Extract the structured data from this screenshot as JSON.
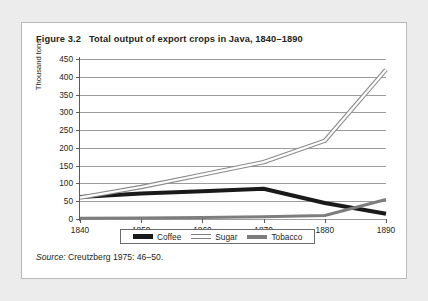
{
  "figure": {
    "title": "Figure 3.2   Total output of export crops in Java, 1840–1890",
    "source_label": "Source:",
    "source_text": " Creutzberg 1975: 46–50."
  },
  "legend": {
    "items": [
      {
        "label": "Coffee",
        "swatch": "coffee-swatch",
        "color": "#1a1a1a"
      },
      {
        "label": "Sugar",
        "swatch": "sugar-swatch",
        "color": "#ffffff"
      },
      {
        "label": "Tobacco",
        "swatch": "tobacco-swatch",
        "color": "#7d7d7d"
      }
    ]
  },
  "chart_data": {
    "type": "line",
    "title": "Total output of export crops in Java, 1840–1890",
    "xlabel": "",
    "ylabel": "Thousand tons",
    "x": [
      1840,
      1850,
      1860,
      1870,
      1880,
      1890
    ],
    "xtick_labels": [
      "1840",
      "1850",
      "1860",
      "1870",
      "1880",
      "1890"
    ],
    "xlim": [
      1840,
      1890
    ],
    "ylim": [
      0,
      450
    ],
    "ytick_labels": [
      "0",
      "50",
      "100",
      "150",
      "200",
      "250",
      "300",
      "350",
      "400",
      "450"
    ],
    "yticks": [
      0,
      50,
      100,
      150,
      200,
      250,
      300,
      350,
      400,
      450
    ],
    "grid": "horizontal",
    "legend_position": "bottom",
    "series": [
      {
        "name": "Coffee",
        "color": "#1a1a1a",
        "style": "thick-solid",
        "values": [
          62,
          72,
          78,
          85,
          45,
          15
        ]
      },
      {
        "name": "Sugar",
        "color": "#ffffff",
        "style": "hollow-double",
        "values": [
          60,
          90,
          125,
          160,
          220,
          420
        ]
      },
      {
        "name": "Tobacco",
        "color": "#7d7d7d",
        "style": "medium-solid",
        "values": [
          2,
          3,
          4,
          6,
          10,
          55
        ]
      }
    ]
  }
}
